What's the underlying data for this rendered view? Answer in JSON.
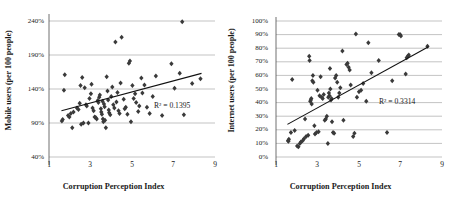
{
  "figure": {
    "panel_count": 2,
    "marker_shape": "diamond",
    "marker_color": "#3a3a3a",
    "gridline_color": "#9a9a9a",
    "trendline_color": "#111111"
  },
  "chart_data": [
    {
      "type": "scatter",
      "id": "mobile-users-vs-cpi",
      "title": "",
      "xlabel": "Corruption Perception Index",
      "ylabel": "Mobile users (per 100 people)",
      "xlim": [
        1,
        9
      ],
      "ylim": [
        40,
        240
      ],
      "xticks": [
        1,
        3,
        5,
        7,
        9
      ],
      "xticklabels": [
        "1",
        "3",
        "5",
        "7",
        "9"
      ],
      "yticks": [
        40,
        90,
        140,
        190,
        240
      ],
      "yticklabels": [
        "40%",
        "90%",
        "140%",
        "190%",
        "240%"
      ],
      "grid": "horizontal",
      "legend": "none",
      "annotation": "R² = 0.1395",
      "r_squared": 0.1395,
      "trendline": {
        "x": [
          1.6,
          8.35
        ],
        "y": [
          108,
          163
        ]
      },
      "points": [
        [
          1.62,
          93
        ],
        [
          1.66,
          95
        ],
        [
          1.72,
          138
        ],
        [
          1.76,
          161
        ],
        [
          1.92,
          101
        ],
        [
          1.98,
          99
        ],
        [
          2.05,
          104
        ],
        [
          2.12,
          83
        ],
        [
          2.18,
          106
        ],
        [
          2.35,
          112
        ],
        [
          2.42,
          110
        ],
        [
          2.48,
          119
        ],
        [
          2.52,
          145
        ],
        [
          2.55,
          88
        ],
        [
          2.6,
          157
        ],
        [
          2.66,
          90
        ],
        [
          2.72,
          142
        ],
        [
          2.78,
          117
        ],
        [
          2.82,
          115
        ],
        [
          2.9,
          90
        ],
        [
          2.95,
          126
        ],
        [
          3.02,
          133
        ],
        [
          3.05,
          147
        ],
        [
          3.1,
          112
        ],
        [
          3.15,
          108
        ],
        [
          3.2,
          99
        ],
        [
          3.25,
          98
        ],
        [
          3.3,
          96
        ],
        [
          3.35,
          123
        ],
        [
          3.38,
          120
        ],
        [
          3.42,
          128
        ],
        [
          3.45,
          131
        ],
        [
          3.5,
          111
        ],
        [
          3.52,
          106
        ],
        [
          3.55,
          103
        ],
        [
          3.58,
          122
        ],
        [
          3.6,
          96
        ],
        [
          3.62,
          92
        ],
        [
          3.65,
          118
        ],
        [
          3.68,
          114
        ],
        [
          3.7,
          94
        ],
        [
          3.74,
          83
        ],
        [
          3.78,
          158
        ],
        [
          3.82,
          137
        ],
        [
          3.85,
          124
        ],
        [
          3.88,
          109
        ],
        [
          3.9,
          105
        ],
        [
          3.95,
          102
        ],
        [
          4.0,
          129
        ],
        [
          4.05,
          143
        ],
        [
          4.1,
          117
        ],
        [
          4.15,
          112
        ],
        [
          4.2,
          209
        ],
        [
          4.25,
          121
        ],
        [
          4.3,
          135
        ],
        [
          4.35,
          108
        ],
        [
          4.4,
          104
        ],
        [
          4.45,
          149
        ],
        [
          4.5,
          216
        ],
        [
          4.6,
          125
        ],
        [
          4.65,
          111
        ],
        [
          4.7,
          113
        ],
        [
          4.78,
          103
        ],
        [
          4.85,
          178
        ],
        [
          4.9,
          181
        ],
        [
          4.95,
          92
        ],
        [
          5.02,
          145
        ],
        [
          5.08,
          126
        ],
        [
          5.15,
          133
        ],
        [
          5.2,
          120
        ],
        [
          5.3,
          107
        ],
        [
          5.35,
          115
        ],
        [
          5.45,
          156
        ],
        [
          5.5,
          134
        ],
        [
          5.6,
          146
        ],
        [
          5.72,
          113
        ],
        [
          5.85,
          104
        ],
        [
          6.0,
          129
        ],
        [
          6.15,
          159
        ],
        [
          6.45,
          101
        ],
        [
          6.9,
          177
        ],
        [
          7.05,
          141
        ],
        [
          7.3,
          163
        ],
        [
          7.42,
          239
        ],
        [
          7.5,
          102
        ],
        [
          7.9,
          148
        ],
        [
          8.3,
          155
        ]
      ]
    },
    {
      "type": "scatter",
      "id": "internet-users-vs-cpi",
      "title": "",
      "xlabel": "Corruption Perception Index",
      "ylabel": "Internet users (per 100 people)",
      "xlim": [
        1,
        9
      ],
      "ylim": [
        0,
        100
      ],
      "xticks": [
        1,
        3,
        5,
        7,
        9
      ],
      "xticklabels": [
        "1",
        "3",
        "5",
        "7",
        "9"
      ],
      "yticks": [
        0,
        10,
        20,
        30,
        40,
        50,
        60,
        70,
        80,
        90,
        100
      ],
      "yticklabels": [
        "0%",
        "10%",
        "20%",
        "30%",
        "40%",
        "50%",
        "60%",
        "70%",
        "80%",
        "90%",
        "100%"
      ],
      "grid": "horizontal",
      "legend": "none",
      "annotation": "R² = 0.3314",
      "r_squared": 0.3314,
      "trendline": {
        "x": [
          1.55,
          8.35
        ],
        "y": [
          24,
          81
        ]
      },
      "points": [
        [
          1.58,
          12
        ],
        [
          1.6,
          11.5
        ],
        [
          1.62,
          13
        ],
        [
          1.72,
          18
        ],
        [
          1.78,
          57
        ],
        [
          1.9,
          19.5
        ],
        [
          2.02,
          8
        ],
        [
          2.08,
          7.5
        ],
        [
          2.15,
          10
        ],
        [
          2.2,
          11
        ],
        [
          2.28,
          12
        ],
        [
          2.35,
          13.5
        ],
        [
          2.4,
          28
        ],
        [
          2.45,
          15
        ],
        [
          2.55,
          16
        ],
        [
          2.6,
          74
        ],
        [
          2.62,
          71
        ],
        [
          2.65,
          41
        ],
        [
          2.68,
          42
        ],
        [
          2.7,
          43
        ],
        [
          2.72,
          39
        ],
        [
          2.75,
          56
        ],
        [
          2.78,
          60
        ],
        [
          2.8,
          55
        ],
        [
          2.85,
          23
        ],
        [
          2.88,
          17
        ],
        [
          2.95,
          18
        ],
        [
          3.0,
          49
        ],
        [
          3.05,
          18.5
        ],
        [
          3.1,
          45
        ],
        [
          3.15,
          59
        ],
        [
          3.2,
          44
        ],
        [
          3.25,
          43
        ],
        [
          3.3,
          46
        ],
        [
          3.35,
          27
        ],
        [
          3.4,
          28
        ],
        [
          3.45,
          30
        ],
        [
          3.5,
          10
        ],
        [
          3.52,
          44
        ],
        [
          3.55,
          47
        ],
        [
          3.58,
          45
        ],
        [
          3.6,
          65
        ],
        [
          3.62,
          50
        ],
        [
          3.65,
          42
        ],
        [
          3.68,
          43
        ],
        [
          3.7,
          26
        ],
        [
          3.75,
          18
        ],
        [
          3.8,
          17.5
        ],
        [
          3.85,
          58
        ],
        [
          3.9,
          60
        ],
        [
          3.95,
          55
        ],
        [
          4.0,
          44
        ],
        [
          4.05,
          47
        ],
        [
          4.1,
          51
        ],
        [
          4.2,
          78
        ],
        [
          4.25,
          27
        ],
        [
          4.4,
          68
        ],
        [
          4.45,
          69
        ],
        [
          4.5,
          66
        ],
        [
          4.55,
          64
        ],
        [
          4.6,
          53
        ],
        [
          4.72,
          15
        ],
        [
          4.78,
          17.5
        ],
        [
          4.85,
          90.5
        ],
        [
          4.9,
          44
        ],
        [
          5.0,
          48
        ],
        [
          5.1,
          49
        ],
        [
          5.2,
          54
        ],
        [
          5.35,
          41
        ],
        [
          5.45,
          84
        ],
        [
          5.6,
          62
        ],
        [
          5.95,
          71
        ],
        [
          6.35,
          18
        ],
        [
          6.6,
          56
        ],
        [
          6.92,
          90
        ],
        [
          6.98,
          90
        ],
        [
          7.02,
          89
        ],
        [
          7.25,
          61
        ],
        [
          7.3,
          73
        ],
        [
          7.35,
          74
        ],
        [
          7.4,
          75
        ],
        [
          8.3,
          81.5
        ]
      ]
    }
  ]
}
